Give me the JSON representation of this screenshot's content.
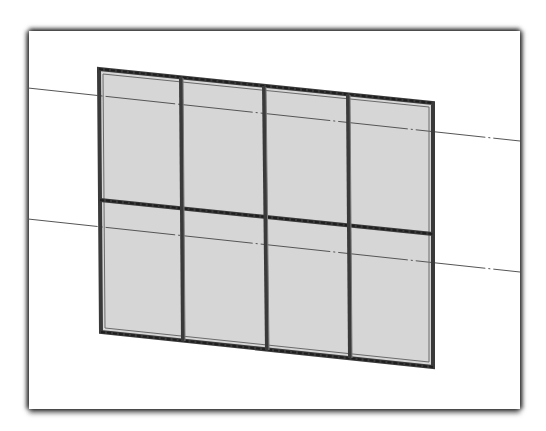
{
  "caption": {
    "text": "",
    "note": "top caption line cropped off-image"
  },
  "drawing": {
    "type": "curtain-wall elevation",
    "columns": 4,
    "rows": 2,
    "colors": {
      "panel_fill": "#d6d6d6",
      "frame_stroke": "#3a3a3a",
      "datum_line": "#555555",
      "frame_border": "#ffffff"
    },
    "outline": {
      "top_left": [
        99,
        69
      ],
      "top_right": [
        433,
        103
      ],
      "bottom_right": [
        433,
        367
      ],
      "bottom_left": [
        101,
        332
      ]
    },
    "mullions_top_x": [
      181,
      264,
      348
    ],
    "mullions_bottom_x": [
      183,
      267,
      350
    ],
    "transom": {
      "left": [
        100,
        200
      ],
      "right": [
        433,
        234
      ]
    },
    "datum_lines": [
      {
        "name": "upper-level-line",
        "from": [
          28,
          88
        ],
        "to": [
          520,
          141
        ]
      },
      {
        "name": "lower-level-line",
        "from": [
          28,
          219
        ],
        "to": [
          520,
          272
        ]
      }
    ]
  }
}
